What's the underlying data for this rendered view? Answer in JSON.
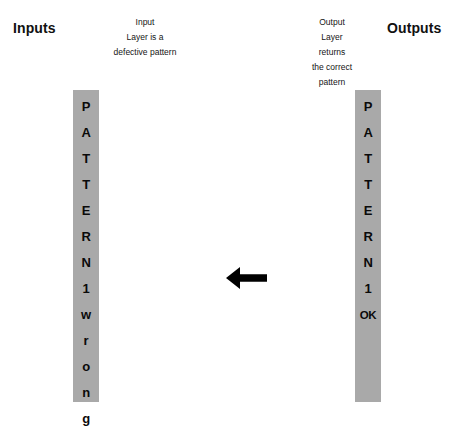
{
  "headings": {
    "inputs": "Inputs",
    "outputs": "Outputs"
  },
  "captions": {
    "input": {
      "lines": [
        "Input",
        "Layer is a",
        "defective pattern"
      ]
    },
    "output": {
      "lines": [
        "Output",
        "Layer",
        "returns",
        "the correct",
        "pattern"
      ]
    }
  },
  "bars": {
    "bar_color": "#a9a9a9",
    "text_color": "#0a0a0a",
    "input": {
      "cells": [
        "P",
        "A",
        "T",
        "T",
        "E",
        "R",
        "N",
        "1",
        "w",
        "r",
        "o",
        "n",
        "g"
      ]
    },
    "output": {
      "cells": [
        "P",
        "A",
        "T",
        "T",
        "E",
        "R",
        "N",
        "1",
        "OK",
        "",
        "",
        "",
        ""
      ]
    }
  },
  "arrow": {
    "direction": "left",
    "color": "#000000"
  }
}
